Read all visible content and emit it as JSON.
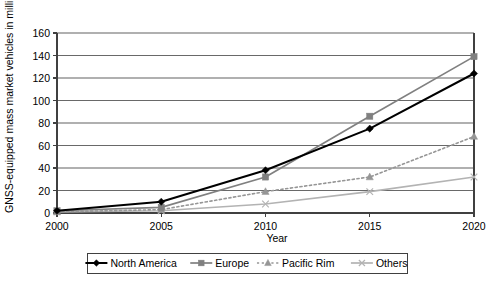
{
  "chart_data": {
    "type": "line",
    "title": "",
    "xlabel": "Year",
    "ylabel": "GNSS-equipped mass market vehicles in millions",
    "x": [
      2000,
      2005,
      2010,
      2015,
      2020
    ],
    "xtick_labels": [
      "2000",
      "2005",
      "2010",
      "2015",
      "2020"
    ],
    "ytick_labels": [
      "0",
      "20",
      "40",
      "60",
      "80",
      "100",
      "120",
      "140",
      "160"
    ],
    "yticks": [
      0,
      20,
      40,
      60,
      80,
      100,
      120,
      140,
      160
    ],
    "ylim": [
      0,
      160
    ],
    "xlim": [
      2000,
      2020
    ],
    "grid": "horizontal",
    "legend_position": "bottom",
    "series": [
      {
        "name": "North America",
        "values": [
          2,
          10,
          38,
          75,
          124
        ],
        "color": "#000000",
        "marker": "diamond",
        "dash": "solid"
      },
      {
        "name": "Europe",
        "values": [
          2,
          5,
          32,
          86,
          139
        ],
        "color": "#808080",
        "marker": "square",
        "dash": "solid"
      },
      {
        "name": "Pacific Rim",
        "values": [
          1,
          3,
          19,
          32,
          68
        ],
        "color": "#969696",
        "marker": "triangle",
        "dash": "dotted"
      },
      {
        "name": "Others",
        "values": [
          1,
          2,
          8,
          19,
          32
        ],
        "color": "#b3b3b3",
        "marker": "cross",
        "dash": "solid"
      }
    ]
  },
  "legend": {
    "items": [
      {
        "label": "North America"
      },
      {
        "label": "Europe"
      },
      {
        "label": "Pacific Rim"
      },
      {
        "label": "Others"
      }
    ]
  },
  "axes": {
    "x_title": "Year",
    "y_title": "GNSS-equipped mass market vehicles in millions"
  }
}
